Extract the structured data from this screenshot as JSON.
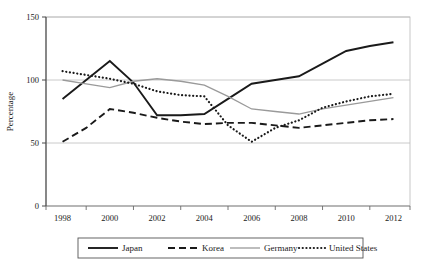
{
  "chart_data": {
    "type": "line",
    "title": "",
    "xlabel": "",
    "ylabel": "Percentage",
    "xlim": [
      1997.3,
      2012.7
    ],
    "ylim": [
      0,
      150
    ],
    "yticks": [
      0,
      50,
      100,
      150
    ],
    "ytick_labels": [
      "0",
      "50",
      "100",
      "150"
    ],
    "xticks": [
      1998,
      1999,
      2000,
      2001,
      2002,
      2003,
      2004,
      2005,
      2006,
      2007,
      2008,
      2009,
      2010,
      2011,
      2012
    ],
    "xtick_labels": [
      "1998",
      "2000",
      "2002",
      "2004",
      "2006",
      "2008",
      "2010",
      "2012"
    ],
    "xtick_label_years": [
      1998,
      2000,
      2002,
      2004,
      2006,
      2008,
      2010,
      2012
    ],
    "grid": "horizontal",
    "legend_position": "bottom",
    "x": [
      1998,
      1999,
      2000,
      2001,
      2002,
      2003,
      2004,
      2005,
      2006,
      2007,
      2008,
      2009,
      2010,
      2011,
      2012
    ],
    "series": [
      {
        "name": "Japan",
        "style": "solid",
        "color": "#1a1a1a",
        "values": [
          85,
          100,
          115,
          98,
          72,
          72,
          73,
          85,
          97,
          100,
          103,
          113,
          123,
          127,
          130
        ]
      },
      {
        "name": "Korea",
        "style": "dashed",
        "color": "#1a1a1a",
        "values": [
          51,
          62,
          77,
          74,
          70,
          67,
          65,
          66,
          66,
          64,
          62,
          64,
          66,
          68,
          69
        ]
      },
      {
        "name": "Germany",
        "style": "solid-gray",
        "color": "#9a9a9a",
        "values": [
          100,
          97,
          94,
          99,
          101,
          99,
          96,
          87,
          77,
          75,
          73,
          77,
          80,
          83,
          86
        ]
      },
      {
        "name": "United States",
        "style": "dotted",
        "color": "#1a1a1a",
        "values": [
          107,
          104,
          101,
          97,
          91,
          88,
          87,
          64,
          51,
          62,
          68,
          78,
          83,
          87,
          89
        ]
      }
    ]
  },
  "legend": {
    "items": [
      {
        "label": "Japan",
        "swatch": "solid-line-swatch"
      },
      {
        "label": "Korea",
        "swatch": "dashed-line-swatch"
      },
      {
        "label": "Germany",
        "swatch": "gray-line-swatch"
      },
      {
        "label": "United States",
        "swatch": "dotted-line-swatch"
      }
    ]
  },
  "axis": {
    "y_title": "Percentage"
  }
}
